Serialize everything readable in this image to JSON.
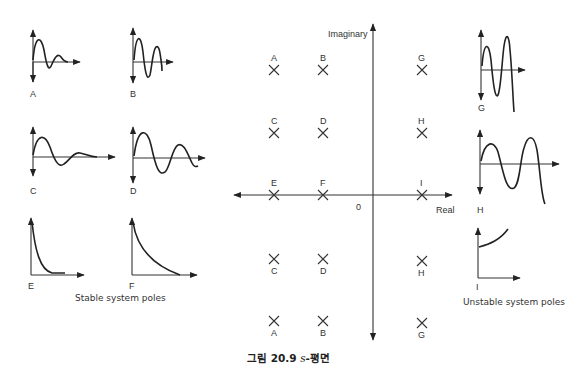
{
  "figure": {
    "caption": "그림 20.9 s-평면",
    "caption_prefix": "그림 20.9 ",
    "caption_var": "s",
    "caption_suffix": "-평면"
  },
  "s_plane": {
    "imag_axis_label": "Imaginary",
    "real_axis_label": "Real",
    "origin_label": "0",
    "poles": [
      {
        "id": "A",
        "label": "A",
        "position": "upper",
        "quadrant": "left"
      },
      {
        "id": "B",
        "label": "B",
        "position": "upper",
        "quadrant": "left"
      },
      {
        "id": "G",
        "label": "G",
        "position": "upper",
        "quadrant": "right"
      },
      {
        "id": "C",
        "label": "C",
        "position": "upper-mid",
        "quadrant": "left"
      },
      {
        "id": "D",
        "label": "D",
        "position": "upper-mid",
        "quadrant": "left"
      },
      {
        "id": "H",
        "label": "H",
        "position": "upper-mid",
        "quadrant": "right"
      },
      {
        "id": "E",
        "label": "E",
        "position": "real-axis",
        "quadrant": "left"
      },
      {
        "id": "F",
        "label": "F",
        "position": "real-axis",
        "quadrant": "left"
      },
      {
        "id": "I",
        "label": "I",
        "position": "real-axis",
        "quadrant": "right"
      },
      {
        "id": "C2",
        "label": "C",
        "position": "lower-mid",
        "quadrant": "left"
      },
      {
        "id": "D2",
        "label": "D",
        "position": "lower-mid",
        "quadrant": "left"
      },
      {
        "id": "H2",
        "label": "H",
        "position": "lower-mid",
        "quadrant": "right"
      },
      {
        "id": "A2",
        "label": "A",
        "position": "lower",
        "quadrant": "left"
      },
      {
        "id": "B2",
        "label": "B",
        "position": "lower",
        "quadrant": "left"
      },
      {
        "id": "G2",
        "label": "G",
        "position": "lower",
        "quadrant": "right"
      }
    ]
  },
  "stable_group": {
    "caption": "Stable system poles",
    "responses": [
      {
        "label": "A",
        "type": "fast-decaying oscillation"
      },
      {
        "label": "B",
        "type": "slowly-decaying oscillation"
      },
      {
        "label": "C",
        "type": "fast-decaying oscillation, lower frequency"
      },
      {
        "label": "D",
        "type": "slowly-decaying oscillation, lower frequency"
      },
      {
        "label": "E",
        "type": "fast exponential decay"
      },
      {
        "label": "F",
        "type": "slow exponential decay"
      }
    ]
  },
  "unstable_group": {
    "caption": "Unstable system poles",
    "responses": [
      {
        "label": "G",
        "type": "growing oscillation, high frequency"
      },
      {
        "label": "H",
        "type": "growing oscillation, low frequency"
      },
      {
        "label": "I",
        "type": "exponential growth"
      }
    ]
  }
}
